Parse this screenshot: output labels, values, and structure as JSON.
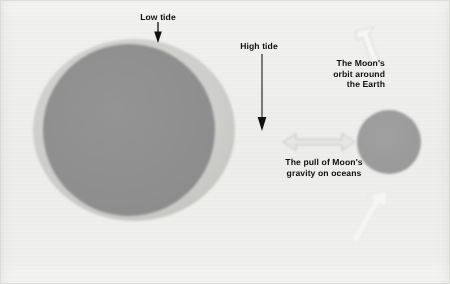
{
  "diagram": {
    "background_color": "#f0f0ee",
    "labels": {
      "low_tide": "Low tide",
      "high_tide": "High tide",
      "moon_orbit": "The Moon's\norbit around\nthe Earth",
      "gravity_pull": "The pull of Moon's\ngravity on oceans"
    },
    "bodies": {
      "earth": {
        "name": "Earth",
        "fill": "#8e8e8e",
        "cx": 129,
        "cy": 130,
        "r": 86
      },
      "ocean_bulge": {
        "name": "Ocean bulge (tidal ellipse)",
        "fill": "#c9c9c7",
        "cx": 134,
        "cy": 130,
        "rx": 101,
        "ry": 91
      },
      "moon": {
        "name": "Moon",
        "fill": "#9a9a9a",
        "cx": 389,
        "cy": 142,
        "r": 32
      }
    },
    "arrows": {
      "low_tide_arrow": {
        "color": "#111111",
        "direction": "down",
        "from_y": 22,
        "to_y": 42
      },
      "high_tide_arrow": {
        "color": "#111111",
        "direction": "down",
        "from_y": 54,
        "to_y": 130
      },
      "gravity_arrow": {
        "color": "#dedede",
        "outline": "#b9b9b7",
        "direction": "double-horizontal"
      },
      "orbit_arrow_top": {
        "color": "#f4f4f2",
        "outline": "#d4d4d1",
        "direction": "up-left"
      },
      "orbit_arrow_bottom": {
        "color": "#f4f4f2",
        "outline": "#dcdcd9",
        "direction": "up-right"
      }
    }
  }
}
